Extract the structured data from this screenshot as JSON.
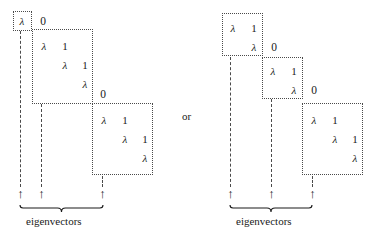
{
  "figure": {
    "connector_label": "or",
    "lambda_glyph": "λ",
    "one_glyph": "1",
    "zero_glyph": "0",
    "arrow_glyph": "↑",
    "caption": "eigenvectors"
  },
  "diagrams": [
    {
      "id": "left",
      "caption": "eigenvectors",
      "blocks": [
        {
          "name": "jordan-block-1x1",
          "size": 1,
          "x": 13,
          "y": 11,
          "w": 19,
          "h": 20,
          "cells": [
            {
              "text": "λ",
              "x": 15,
              "y": 15,
              "italic": true
            }
          ]
        },
        {
          "name": "jordan-block-3x3",
          "size": 3,
          "x": 32,
          "y": 29,
          "w": 61,
          "h": 75,
          "cells": [
            {
              "text": "λ",
              "x": 37,
              "y": 40,
              "italic": true
            },
            {
              "text": "1",
              "x": 58,
              "y": 40,
              "italic": false
            },
            {
              "text": "λ",
              "x": 58,
              "y": 59,
              "italic": true
            },
            {
              "text": "1",
              "x": 78,
              "y": 59,
              "italic": false
            },
            {
              "text": "λ",
              "x": 78,
              "y": 78,
              "italic": true
            }
          ]
        },
        {
          "name": "jordan-block-3x3-b",
          "size": 3,
          "x": 92,
          "y": 103,
          "w": 61,
          "h": 72,
          "cells": [
            {
              "text": "λ",
              "x": 97,
              "y": 114,
              "italic": true
            },
            {
              "text": "1",
              "x": 118,
              "y": 114,
              "italic": false
            },
            {
              "text": "λ",
              "x": 118,
              "y": 133,
              "italic": true
            },
            {
              "text": "1",
              "x": 138,
              "y": 133,
              "italic": false
            },
            {
              "text": "λ",
              "x": 138,
              "y": 152,
              "italic": true
            }
          ]
        }
      ],
      "outside_zeros": [
        {
          "text": "0",
          "x": 36,
          "y": 15
        },
        {
          "text": "0",
          "x": 96,
          "y": 88
        }
      ],
      "leaders": [
        {
          "x": 20,
          "y": 31,
          "h": 156
        },
        {
          "x": 41,
          "y": 104,
          "h": 83
        },
        {
          "x": 102,
          "y": 176,
          "h": 11
        }
      ],
      "arrows": [
        {
          "x": 16,
          "y": 188
        },
        {
          "x": 37,
          "y": 188
        },
        {
          "x": 98,
          "y": 188
        }
      ],
      "brace": {
        "x": 19,
        "y": 205,
        "w": 85
      },
      "caption_pos": {
        "x": 26,
        "y": 215
      }
    },
    {
      "id": "right",
      "caption": "eigenvectors",
      "blocks": [
        {
          "name": "jordan-block-2x2",
          "size": 2,
          "x": 222,
          "y": 13,
          "w": 41,
          "h": 43,
          "cells": [
            {
              "text": "λ",
              "x": 226,
              "y": 22,
              "italic": true
            },
            {
              "text": "1",
              "x": 247,
              "y": 22,
              "italic": false
            },
            {
              "text": "λ",
              "x": 247,
              "y": 41,
              "italic": true
            }
          ]
        },
        {
          "name": "jordan-block-2x2-b",
          "size": 2,
          "x": 262,
          "y": 57,
          "w": 41,
          "h": 42,
          "cells": [
            {
              "text": "λ",
              "x": 266,
              "y": 65,
              "italic": true
            },
            {
              "text": "1",
              "x": 287,
              "y": 65,
              "italic": false
            },
            {
              "text": "λ",
              "x": 287,
              "y": 84,
              "italic": true
            }
          ]
        },
        {
          "name": "jordan-block-3x3-c",
          "size": 3,
          "x": 302,
          "y": 103,
          "w": 61,
          "h": 72,
          "cells": [
            {
              "text": "λ",
              "x": 307,
              "y": 114,
              "italic": true
            },
            {
              "text": "1",
              "x": 328,
              "y": 114,
              "italic": false
            },
            {
              "text": "λ",
              "x": 328,
              "y": 133,
              "italic": true
            },
            {
              "text": "1",
              "x": 348,
              "y": 133,
              "italic": false
            },
            {
              "text": "λ",
              "x": 348,
              "y": 152,
              "italic": true
            }
          ]
        }
      ],
      "outside_zeros": [
        {
          "text": "0",
          "x": 267,
          "y": 41
        },
        {
          "text": "0",
          "x": 307,
          "y": 84
        }
      ],
      "leaders": [
        {
          "x": 230,
          "y": 57,
          "h": 130
        },
        {
          "x": 271,
          "y": 99,
          "h": 88
        },
        {
          "x": 312,
          "y": 176,
          "h": 11
        }
      ],
      "arrows": [
        {
          "x": 226,
          "y": 188
        },
        {
          "x": 267,
          "y": 188
        },
        {
          "x": 308,
          "y": 188
        }
      ],
      "brace": {
        "x": 229,
        "y": 205,
        "w": 84
      },
      "caption_pos": {
        "x": 236,
        "y": 215
      }
    }
  ],
  "connector_pos": {
    "x": 182,
    "y": 110
  }
}
